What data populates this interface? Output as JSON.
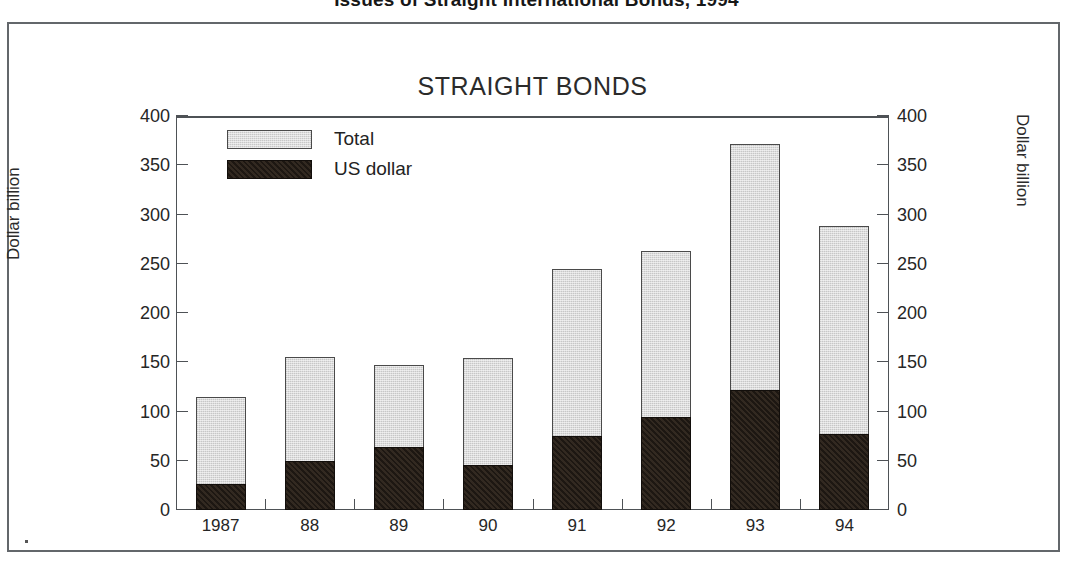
{
  "page": {
    "headline": "Issues of Straight International Bonds, 1994"
  },
  "chart_data": {
    "type": "bar",
    "subtype": "overlaid-stacked",
    "title": "STRAIGHT BONDS",
    "xlabel": "",
    "ylabel": "Dollar billion",
    "ylabel_right": "Dollar billion",
    "ylim": [
      0,
      400
    ],
    "ytick_step": 50,
    "yticks": [
      0,
      50,
      100,
      150,
      200,
      250,
      300,
      350,
      400
    ],
    "ytick_labels": [
      "0",
      "50",
      "100",
      "150",
      "200",
      "250",
      "300",
      "350",
      "400"
    ],
    "ytick_labels_right": [
      "0",
      "50",
      "100",
      "150",
      "200",
      "250",
      "300",
      "350",
      "400"
    ],
    "grid": false,
    "legend_position": "upper-left-inside",
    "categories": [
      "1987",
      "88",
      "89",
      "90",
      "91",
      "92",
      "93",
      "94"
    ],
    "series": [
      {
        "name": "Total",
        "color": "#dcdcdc",
        "values": [
          115,
          155,
          147,
          154,
          245,
          263,
          372,
          288
        ]
      },
      {
        "name": "US dollar",
        "color": "#1d1712",
        "values": [
          26,
          50,
          64,
          46,
          75,
          94,
          122,
          77
        ]
      }
    ]
  }
}
